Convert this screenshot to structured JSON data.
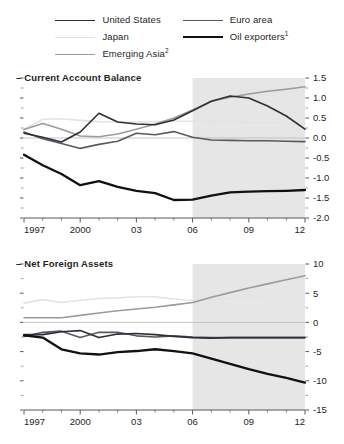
{
  "legend": {
    "columns": [
      {
        "items": [
          {
            "label": "United States",
            "sup": "",
            "color": "#2b3038",
            "width": 1.6
          },
          {
            "label": "Japan",
            "sup": "",
            "color": "#e3e3e3",
            "width": 1.6
          },
          {
            "label": "Emerging Asia",
            "sup": "2",
            "color": "#9b9b9b",
            "width": 1.6
          }
        ]
      },
      {
        "items": [
          {
            "label": "Euro area",
            "sup": "",
            "color": "#565b61",
            "width": 1.6
          },
          {
            "label": "Oil exporters",
            "sup": "1",
            "color": "#111111",
            "width": 2.3
          }
        ]
      }
    ]
  },
  "panels": {
    "top": {
      "title": "Current Account Balance",
      "title_dash": "–"
    },
    "bottom": {
      "title": "Net Foreign Assets",
      "title_dash": "–"
    }
  },
  "chart_data": [
    {
      "id": "current-account-balance",
      "type": "line",
      "title": "Current Account Balance",
      "xlabel": "",
      "ylabel": "",
      "x": [
        1997,
        1998,
        1999,
        2000,
        2001,
        2002,
        2003,
        2004,
        2005,
        2006,
        2007,
        2008,
        2009,
        2010,
        2011,
        2012
      ],
      "xlim": [
        1997,
        2012
      ],
      "ylim": [
        -2.0,
        1.5
      ],
      "yticks": [
        1.5,
        1.0,
        0.5,
        0.0,
        -0.5,
        -1.0,
        -1.5,
        -2.0
      ],
      "ytick_labels": [
        "1.5",
        "1.0",
        "0.5",
        "0.0",
        "-0.5",
        "-1.0",
        "-1.5",
        "-2.0"
      ],
      "xticks": [
        1997,
        2000,
        2003,
        2006,
        2009,
        2012
      ],
      "xtick_labels": [
        "1997",
        "2000",
        "03",
        "06",
        "09",
        "12"
      ],
      "yaxis_position": "right",
      "grid": false,
      "zero_line": true,
      "shaded_region": {
        "from": 2006,
        "to": 2012,
        "color": "#e6e6e6",
        "meaning": "projection"
      },
      "legend_position": "top",
      "series": [
        {
          "name": "United States",
          "color": "#2b3038",
          "width": 1.6,
          "values": [
            0.12,
            0.02,
            -0.1,
            0.15,
            0.62,
            0.4,
            0.35,
            0.33,
            0.45,
            0.68,
            0.92,
            1.05,
            1.0,
            0.8,
            0.55,
            0.22
          ]
        },
        {
          "name": "Japan",
          "color": "#e3e3e3",
          "width": 1.6,
          "values": [
            0.22,
            0.47,
            0.48,
            0.44,
            0.41,
            0.4,
            0.4,
            0.41,
            0.42,
            0.42,
            0.41,
            0.4,
            0.39,
            0.38,
            0.37,
            0.36
          ]
        },
        {
          "name": "Emerging Asia",
          "color": "#9b9b9b",
          "width": 1.6,
          "values": [
            0.21,
            0.36,
            0.22,
            0.05,
            0.03,
            0.1,
            0.22,
            0.35,
            0.5,
            0.7,
            0.92,
            1.02,
            1.1,
            1.17,
            1.22,
            1.28
          ]
        },
        {
          "name": "Euro area",
          "color": "#565b61",
          "width": 1.6,
          "values": [
            0.15,
            -0.02,
            -0.14,
            -0.26,
            -0.16,
            -0.08,
            0.12,
            0.08,
            0.16,
            0.02,
            -0.05,
            -0.06,
            -0.07,
            -0.07,
            -0.08,
            -0.09
          ]
        },
        {
          "name": "Oil exporters",
          "color": "#111111",
          "width": 2.3,
          "values": [
            -0.42,
            -0.68,
            -0.9,
            -1.18,
            -1.08,
            -1.22,
            -1.32,
            -1.38,
            -1.55,
            -1.54,
            -1.44,
            -1.36,
            -1.34,
            -1.33,
            -1.32,
            -1.3
          ]
        }
      ]
    },
    {
      "id": "net-foreign-assets",
      "type": "line",
      "title": "Net Foreign Assets",
      "xlabel": "",
      "ylabel": "",
      "x": [
        1997,
        1998,
        1999,
        2000,
        2001,
        2002,
        2003,
        2004,
        2005,
        2006,
        2007,
        2008,
        2009,
        2010,
        2011,
        2012
      ],
      "xlim": [
        1997,
        2012
      ],
      "ylim": [
        -15,
        10
      ],
      "yticks": [
        10,
        5,
        0,
        -5,
        -10,
        -15
      ],
      "ytick_labels": [
        "10",
        "5",
        "0",
        "-5",
        "-10",
        "-15"
      ],
      "xticks": [
        1997,
        2000,
        2003,
        2006,
        2009,
        2012
      ],
      "xtick_labels": [
        "1997",
        "2000",
        "03",
        "06",
        "09",
        "12"
      ],
      "yaxis_position": "right",
      "grid": false,
      "zero_line": true,
      "shaded_region": {
        "from": 2006,
        "to": 2012,
        "color": "#e6e6e6",
        "meaning": "projection"
      },
      "legend_position": "top",
      "series": [
        {
          "name": "United States",
          "color": "#2b3038",
          "width": 1.6,
          "values": [
            -2.1,
            -2.1,
            -1.6,
            -1.4,
            -2.6,
            -2.0,
            -1.9,
            -2.1,
            -2.4,
            -2.6,
            -2.7,
            -2.6,
            -2.6,
            -2.6,
            -2.6,
            -2.6
          ]
        },
        {
          "name": "Japan",
          "color": "#e3e3e3",
          "width": 1.6,
          "values": [
            3.3,
            3.9,
            3.4,
            3.8,
            4.1,
            4.2,
            4.4,
            4.4,
            4.0,
            3.7,
            3.9,
            4.1,
            4.4,
            4.5,
            4.5,
            4.5
          ]
        },
        {
          "name": "Emerging Asia",
          "color": "#9b9b9b",
          "width": 1.6,
          "values": [
            0.8,
            0.8,
            0.8,
            1.2,
            1.6,
            2.0,
            2.3,
            2.6,
            3.0,
            3.4,
            4.3,
            5.1,
            5.9,
            6.6,
            7.3,
            8.0
          ]
        },
        {
          "name": "Euro area",
          "color": "#565b61",
          "width": 1.6,
          "values": [
            -2.4,
            -1.7,
            -1.5,
            -2.6,
            -1.7,
            -1.7,
            -2.3,
            -2.5,
            -2.3,
            -2.5,
            -2.6,
            -2.6,
            -2.6,
            -2.6,
            -2.6,
            -2.6
          ]
        },
        {
          "name": "Oil exporters",
          "color": "#111111",
          "width": 2.3,
          "values": [
            -2.2,
            -2.6,
            -4.6,
            -5.3,
            -5.5,
            -5.1,
            -4.9,
            -4.6,
            -4.9,
            -5.3,
            -6.2,
            -7.1,
            -8.0,
            -8.8,
            -9.5,
            -10.3
          ]
        }
      ]
    }
  ]
}
